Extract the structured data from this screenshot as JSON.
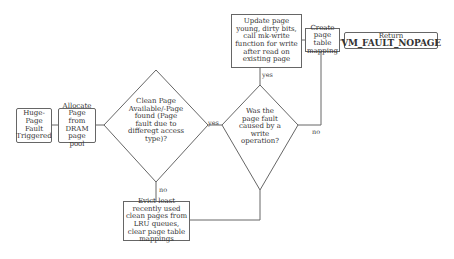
{
  "nodes": {
    "start": {
      "label": "Huge-Page Fault Triggered"
    },
    "allocate": {
      "label": "Allocate Page from DRAM page pool"
    },
    "decision_clean": {
      "label": "Clean Page Available/-Page found (Page fault due to differegt access type)?"
    },
    "decision_write": {
      "label": "Was the page fault caused by a write operation?"
    },
    "update": {
      "label": "Update page young, dirty bits, call mk-write function for write after read on existing page"
    },
    "create": {
      "label": "Create page table mapping"
    },
    "return": {
      "prefix": "Return",
      "code": "VM_FAULT_NOPAGE"
    },
    "evict": {
      "label": "Evict least recently used clean pages from LRU queues, clear page table mappings"
    }
  },
  "edges": {
    "clean_yes": "yes",
    "clean_no": "no",
    "write_yes": "yes",
    "write_no": "no"
  },
  "colors": {
    "line": "#666666",
    "text": "#333333",
    "background": "#ffffff"
  }
}
